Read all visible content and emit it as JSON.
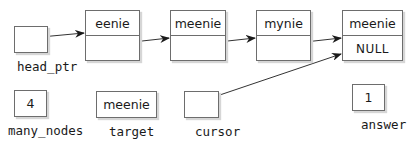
{
  "diagram": {
    "type": "linked-list",
    "nodes": [
      {
        "data": "eenie",
        "link": ""
      },
      {
        "data": "meenie",
        "link": ""
      },
      {
        "data": "mynie",
        "link": ""
      },
      {
        "data": "meenie",
        "link": "NULL"
      }
    ],
    "variables": {
      "head_ptr": {
        "label": "head_ptr",
        "value": "",
        "points_to": "node 1 (eenie)"
      },
      "many_nodes": {
        "label": "many_nodes",
        "value": "4"
      },
      "target": {
        "label": "target",
        "value": "meenie"
      },
      "cursor": {
        "label": "cursor",
        "value": "",
        "points_to": "node 4 (meenie)"
      },
      "answer": {
        "label": "answer",
        "value": "1"
      }
    }
  }
}
